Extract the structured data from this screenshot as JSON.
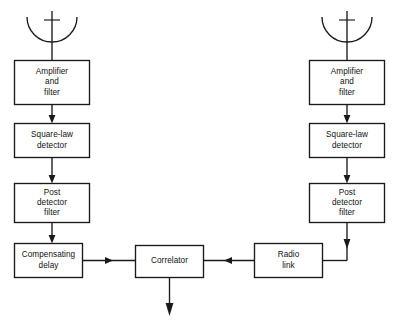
{
  "diagram": {
    "background_color": "#ffffff",
    "line_color": "#1a1a1a",
    "blocks": [
      {
        "id": "left-antenna",
        "icon": "parabolic-antenna-icon",
        "label_lines": []
      },
      {
        "id": "left-amplifier-filter",
        "label_lines": [
          "Amplifier",
          "and",
          "filter"
        ]
      },
      {
        "id": "left-square-law-detector",
        "label_lines": [
          "Square-law",
          "detector"
        ]
      },
      {
        "id": "left-post-detector-filter",
        "label_lines": [
          "Post",
          "detector",
          "filter"
        ]
      },
      {
        "id": "compensating-delay",
        "label_lines": [
          "Compensating",
          "delay"
        ]
      },
      {
        "id": "correlator",
        "label_lines": [
          "Correlator"
        ]
      },
      {
        "id": "radio-link",
        "label_lines": [
          "Radio",
          "link"
        ]
      },
      {
        "id": "right-antenna",
        "icon": "parabolic-antenna-icon",
        "label_lines": []
      },
      {
        "id": "right-amplifier-filter",
        "label_lines": [
          "Amplifier",
          "and",
          "filter"
        ]
      },
      {
        "id": "right-square-law-detector",
        "label_lines": [
          "Square-law",
          "detector"
        ]
      },
      {
        "id": "right-post-detector-filter",
        "label_lines": [
          "Post",
          "detector",
          "filter"
        ]
      }
    ],
    "labels": {
      "amplifier_line1": "Amplifier",
      "amplifier_line2": "and",
      "amplifier_line3": "filter",
      "square_law_line1": "Square-law",
      "square_law_line2": "detector",
      "post_detector_line1": "Post",
      "post_detector_line2": "detector",
      "post_detector_line3": "filter",
      "compensating_line1": "Compensating",
      "compensating_line2": "delay",
      "correlator": "Correlator",
      "radio_link_line1": "Radio",
      "radio_link_line2": "link"
    },
    "connections": [
      {
        "from": "left-antenna",
        "to": "left-amplifier-filter",
        "arrow": "down"
      },
      {
        "from": "left-amplifier-filter",
        "to": "left-square-law-detector",
        "arrow": "down"
      },
      {
        "from": "left-square-law-detector",
        "to": "left-post-detector-filter",
        "arrow": "down"
      },
      {
        "from": "left-post-detector-filter",
        "to": "compensating-delay",
        "arrow": "down"
      },
      {
        "from": "compensating-delay",
        "to": "correlator",
        "arrow": "right"
      },
      {
        "from": "right-antenna",
        "to": "right-amplifier-filter",
        "arrow": "down"
      },
      {
        "from": "right-amplifier-filter",
        "to": "right-square-law-detector",
        "arrow": "down"
      },
      {
        "from": "right-square-law-detector",
        "to": "right-post-detector-filter",
        "arrow": "down"
      },
      {
        "from": "right-post-detector-filter",
        "to": "radio-link",
        "arrow": "down-then-left"
      },
      {
        "from": "radio-link",
        "to": "correlator",
        "arrow": "left"
      },
      {
        "from": "correlator",
        "to": "output",
        "arrow": "down"
      }
    ]
  }
}
